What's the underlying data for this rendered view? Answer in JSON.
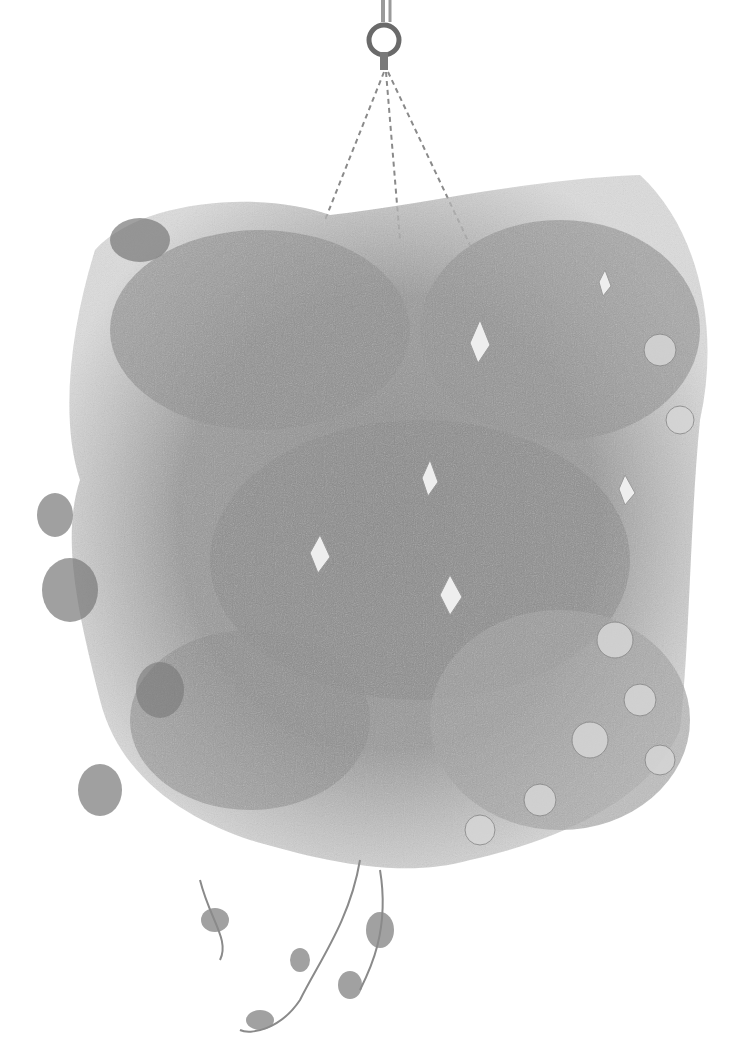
{
  "artwork": {
    "subject": "pencil drawing of a hanging flower basket",
    "medium": "graphite",
    "palette": {
      "background": "#ffffff",
      "dark": "#3a3a3a",
      "mid": "#7a7a7a",
      "light": "#b8b8b8",
      "highlight": "#e6e6e6"
    },
    "elements": [
      "hanging-ring",
      "chains",
      "foliage-mass",
      "fuchsia-flowers",
      "petunia-flowers",
      "trailing-ivy"
    ]
  }
}
